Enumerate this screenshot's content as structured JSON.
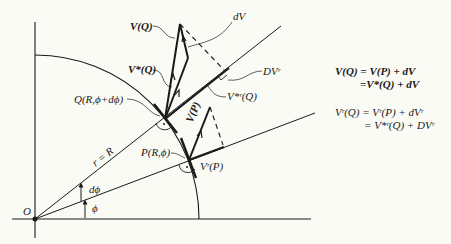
{
  "diagram": {
    "labels": {
      "V_Q": "V(Q)",
      "dV": "dV",
      "Vstar_Q": "V*(Q)",
      "DVr": "DVʳ",
      "Q_point": "Q(R,ϕ+dϕ)",
      "Vstar_r_Q": "V*ʳ(Q)",
      "V_P": "V(P)",
      "P_point": "P(R,ϕ)",
      "Vr_P": "Vʳ(P)",
      "r_eq_R": "r = R",
      "dphi": "dϕ",
      "phi": "ϕ",
      "origin": "O"
    },
    "equations": {
      "eq1_line1": "V(Q) = V(P) + dV",
      "eq1_line2": "=V*(Q) + dV",
      "eq2_line1": "Vʳ(Q) = Vʳ(P) + dVʳ",
      "eq2_line2": "= V*ʳ(Q) + DVʳ"
    },
    "colors": {
      "ink": "#1a1a1a",
      "paper": "#fbfbf6"
    }
  }
}
